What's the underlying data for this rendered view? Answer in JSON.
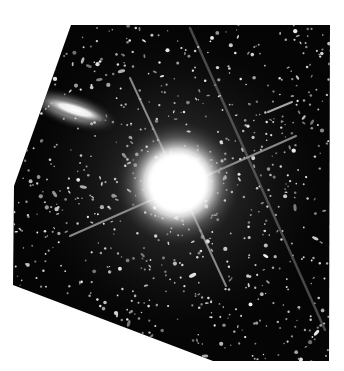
{
  "image": {
    "description": "Astronomical exposure: bright saturated star with diffraction spikes, elongated galaxy at upper left, dense field of faint stars on black sky, irregular image footprint on white background",
    "background_color": "#ffffff",
    "sky_color": "#050505",
    "footprint_polygon": [
      [
        71,
        25
      ],
      [
        330,
        25
      ],
      [
        329,
        361
      ],
      [
        213,
        361
      ],
      [
        13,
        285
      ],
      [
        14,
        186
      ]
    ],
    "bright_star": {
      "cx": 178,
      "cy": 183,
      "radius": 48
    },
    "galaxy": {
      "cx": 75,
      "cy": 110,
      "rx": 40,
      "ry": 11,
      "angle_deg": 18
    },
    "diffraction_spikes": [
      {
        "x1": 130,
        "y1": 78,
        "x2": 226,
        "y2": 286
      },
      {
        "x1": 70,
        "y1": 236,
        "x2": 296,
        "y2": 136
      },
      {
        "x1": 190,
        "y1": 28,
        "x2": 325,
        "y2": 330
      }
    ],
    "satellite_streak": {
      "x1": 268,
      "y1": 112,
      "x2": 292,
      "y2": 102
    }
  }
}
